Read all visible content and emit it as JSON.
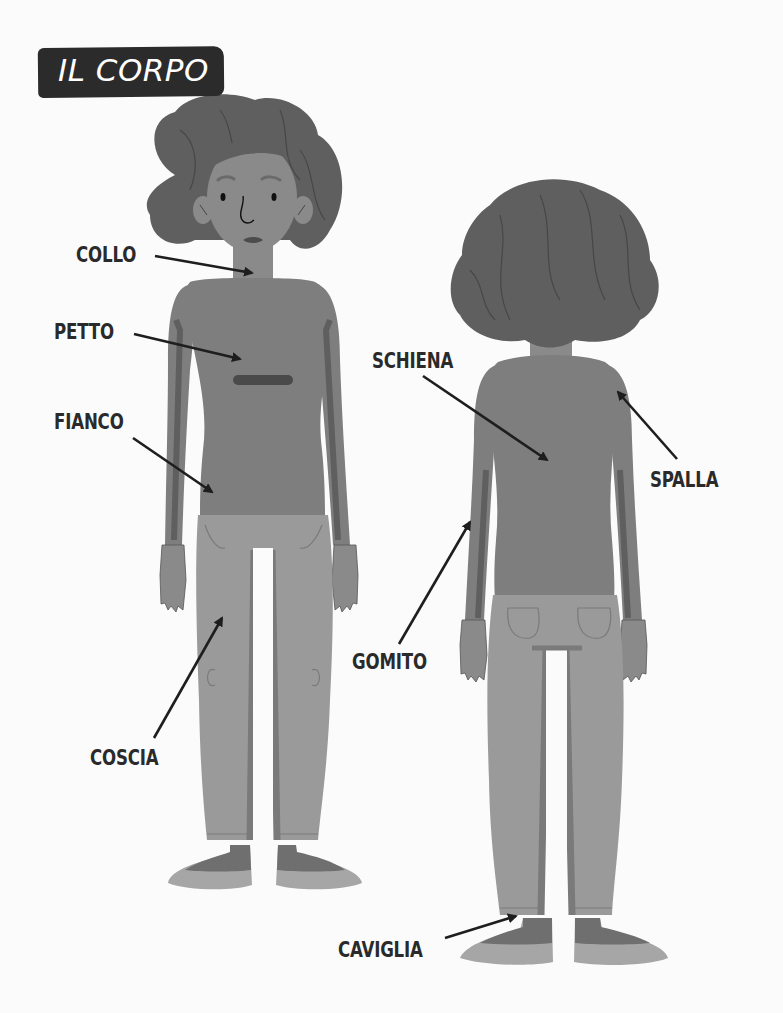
{
  "title": "IL CORPO",
  "figures": [
    {
      "name": "front-view",
      "description": "girl seen from the front"
    },
    {
      "name": "back-view",
      "description": "girl seen from behind"
    }
  ],
  "labels": {
    "collo": "COLLO",
    "petto": "PETTO",
    "fianco": "FIANCO",
    "coscia": "COSCIA",
    "schiena": "SCHIENA",
    "spalla": "SPALLA",
    "gomito": "GOMITO",
    "caviglia": "CAVIGLIA"
  },
  "colors": {
    "background": "#fbfbfb",
    "title_badge": "#2b2b2b",
    "title_text": "#ffffff",
    "label_text": "#2a2a2a",
    "hair": "#5f5f5f",
    "skin": "#8a8a8a",
    "shirt": "#7e7e7e",
    "shirt_shade": "#6a6a6a",
    "pants": "#9a9a9a",
    "pants_shade": "#7a7a7a",
    "shoes": "#a6a6a6",
    "shoe_top": "#6f6f6f",
    "arrow": "#1e1e1e"
  }
}
